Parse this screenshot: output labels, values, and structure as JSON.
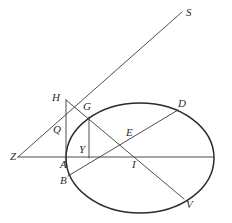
{
  "figure": {
    "kind": "euclidean-geometry-diagram",
    "width": 232,
    "height": 223,
    "background_color": "#ffffff",
    "line_color": "#3a3a3a",
    "curve_color": "#2b2b2b",
    "label_color": "#2b2b2b"
  },
  "ellipse": {
    "center_x": 140,
    "center_y": 158,
    "radius_x": 74,
    "radius_y": 55
  },
  "points": [
    {
      "id": "S",
      "label": "S",
      "x": 182,
      "y": 12,
      "label_x": 186,
      "label_y": 16
    },
    {
      "id": "H",
      "label": "H",
      "x": 66,
      "y": 100,
      "label_x": 52,
      "label_y": 101
    },
    {
      "id": "G",
      "label": "G",
      "x": 89,
      "y": 117,
      "label_x": 83,
      "label_y": 110
    },
    {
      "id": "D",
      "label": "D",
      "x": 178,
      "y": 110,
      "label_x": 178,
      "label_y": 107
    },
    {
      "id": "Q",
      "label": "Q",
      "x": 66,
      "y": 131,
      "label_x": 53,
      "label_y": 133
    },
    {
      "id": "E",
      "label": "E",
      "x": 127,
      "y": 139,
      "label_x": 126,
      "label_y": 136
    },
    {
      "id": "Z",
      "label": "Z",
      "x": 18,
      "y": 157,
      "label_x": 10,
      "label_y": 160
    },
    {
      "id": "Y",
      "label": "Y",
      "x": 89,
      "y": 150,
      "label_x": 79,
      "label_y": 153
    },
    {
      "id": "A",
      "label": "A",
      "x": 66,
      "y": 157,
      "label_x": 60,
      "label_y": 168
    },
    {
      "id": "I",
      "label": "I",
      "x": 133,
      "y": 157,
      "label_x": 132,
      "label_y": 168
    },
    {
      "id": "B",
      "label": "B",
      "x": 68,
      "y": 176,
      "label_x": 60,
      "label_y": 184
    },
    {
      "id": "V",
      "label": "V",
      "x": 184,
      "y": 199,
      "label_x": 186,
      "label_y": 208
    }
  ],
  "segments": [
    {
      "id": "Z-S",
      "from": "Z",
      "to": "S",
      "x1": 18,
      "y1": 157,
      "x2": 182,
      "y2": 12
    },
    {
      "id": "H-V",
      "from": "H",
      "to": "V",
      "x1": 66,
      "y1": 100,
      "x2": 184,
      "y2": 199
    },
    {
      "id": "H-A",
      "from": "H",
      "to": "A",
      "x1": 66,
      "y1": 100,
      "x2": 66,
      "y2": 163
    },
    {
      "id": "G-Y",
      "from": "G",
      "to": "Y",
      "x1": 89,
      "y1": 117,
      "x2": 89,
      "y2": 158
    },
    {
      "id": "B-D",
      "from": "B",
      "to": "D",
      "x1": 68,
      "y1": 176,
      "x2": 178,
      "y2": 110
    },
    {
      "id": "Z-Rim",
      "from": "Z",
      "to": "rim",
      "x1": 18,
      "y1": 157,
      "x2": 214,
      "y2": 157
    }
  ]
}
